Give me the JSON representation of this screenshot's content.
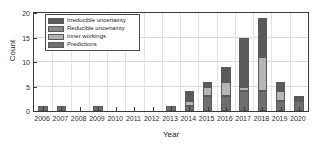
{
  "chart_data": {
    "type": "bar",
    "subtype": "stacked-bar",
    "title": "",
    "xlabel": "Year",
    "ylabel": "Count",
    "grid": true,
    "legend_position": "upper-left",
    "xlim": [
      2005.5,
      2020.5
    ],
    "ylim": [
      0,
      20
    ],
    "yticks": [
      0,
      5,
      10,
      15,
      20
    ],
    "categories": [
      "2006",
      "2007",
      "2008",
      "2009",
      "2010",
      "2011",
      "2012",
      "2013",
      "2014",
      "2015",
      "2016",
      "2017",
      "2018",
      "2019",
      "2020"
    ],
    "series": [
      {
        "name": "Predictions",
        "color": "#6e6e6e",
        "values": [
          1,
          1,
          0,
          1,
          0,
          0,
          0,
          1,
          1,
          3,
          3,
          4,
          4,
          2,
          2
        ]
      },
      {
        "name": "Inner workings",
        "color": "#b5b5b5",
        "values": [
          0,
          0,
          0,
          0,
          0,
          0,
          0,
          0,
          1,
          2,
          3,
          1,
          7,
          2,
          0
        ]
      },
      {
        "name": "Reducible uncertainty",
        "color": "#8a8a8a",
        "values": [
          0,
          0,
          0,
          0,
          0,
          0,
          0,
          0,
          0,
          0,
          0,
          0,
          0,
          0,
          0
        ]
      },
      {
        "name": "Irreducible uncertainty",
        "color": "#5a5a5a",
        "values": [
          0,
          0,
          0,
          0,
          0,
          0,
          0,
          0,
          2,
          1,
          3,
          10,
          8,
          2,
          1
        ]
      }
    ],
    "totals": [
      1,
      1,
      0,
      1,
      0,
      0,
      0,
      1,
      4,
      6,
      9,
      15,
      19,
      6,
      3
    ]
  },
  "legend": {
    "items": [
      {
        "label": "Irreducible uncertainty",
        "color": "#5a5a5a"
      },
      {
        "label": "Reducible uncertainty",
        "color": "#8a8a8a"
      },
      {
        "label": "Inner workings",
        "color": "#b5b5b5"
      },
      {
        "label": "Predictions",
        "color": "#6e6e6e"
      }
    ]
  }
}
